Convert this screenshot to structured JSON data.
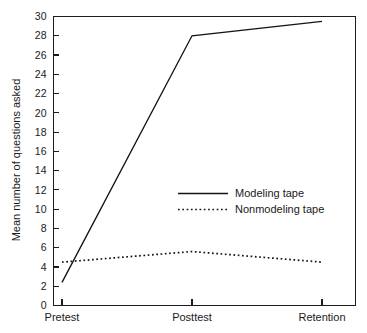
{
  "chart_data": {
    "type": "line",
    "title": "",
    "subtitle": "",
    "xlabel": "",
    "ylabel": "Mean number of questions asked",
    "categories": [
      "Pretest",
      "Posttest",
      "Retention"
    ],
    "ylim": [
      0,
      30
    ],
    "ytick_step": 2,
    "yticks": [
      0,
      2,
      4,
      6,
      8,
      10,
      12,
      14,
      16,
      18,
      20,
      22,
      24,
      26,
      28,
      30
    ],
    "ytick_labels": [
      "0",
      "2",
      "4",
      "6",
      "8",
      "10",
      "12",
      "14",
      "16",
      "18",
      "20",
      "22",
      "24",
      "26",
      "28",
      "30"
    ],
    "grid": false,
    "legend_position": "inside-center-right",
    "series": [
      {
        "name": "Modeling tape",
        "style": "solid",
        "color": "#141414",
        "values": [
          2.4,
          28.0,
          29.5
        ]
      },
      {
        "name": "Nonmodeling tape",
        "style": "dotted",
        "color": "#141414",
        "values": [
          4.5,
          5.6,
          4.5
        ]
      }
    ],
    "annotations": []
  },
  "legend": {
    "entries": [
      {
        "label": "Modeling tape"
      },
      {
        "label": "Nonmodeling tape"
      }
    ]
  }
}
